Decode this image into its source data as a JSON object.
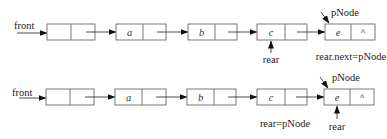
{
  "diagrams": [
    {
      "name": "before",
      "head_label": "front",
      "nodes": [
        {
          "value": "",
          "next": ""
        },
        {
          "value": "a",
          "next": ""
        },
        {
          "value": "b",
          "next": ""
        },
        {
          "value": "c",
          "next": ""
        },
        {
          "value": "e",
          "next": "^"
        }
      ],
      "pointer_new": "pNode",
      "pointer_rear": "rear",
      "rear_points_to": "c",
      "caption": "rear.next=pNode"
    },
    {
      "name": "after",
      "head_label": "front",
      "nodes": [
        {
          "value": "",
          "next": ""
        },
        {
          "value": "a",
          "next": ""
        },
        {
          "value": "b",
          "next": ""
        },
        {
          "value": "c",
          "next": ""
        },
        {
          "value": "e",
          "next": "^"
        }
      ],
      "pointer_new": "pNode",
      "pointer_rear": "rear",
      "rear_points_to": "e",
      "caption": "rear=pNode"
    }
  ]
}
